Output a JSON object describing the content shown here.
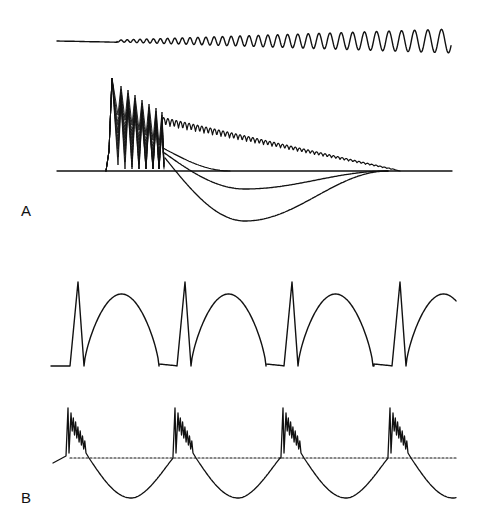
{
  "figure": {
    "panels": [
      {
        "label": "A",
        "traces": [
          {
            "name": "input-chirp",
            "description": "sinusoidal stimulus with increasing amplitude and decreasing frequency"
          },
          {
            "name": "membrane-responses",
            "description": "overlaid voltage responses: initial spike burst, decaying oscillation, and three hyperpolarizing afterpotentials of increasing depth"
          }
        ]
      },
      {
        "label": "B",
        "traces": [
          {
            "name": "periodic-input",
            "description": "periodic waveform with sharp spike followed by broad hump, 4 cycles"
          },
          {
            "name": "bursting-response",
            "description": "spike bursts followed by hyperpolarization, dotted reference baseline",
            "cycles": 4
          }
        ]
      }
    ],
    "colors": {
      "ink": "#111111",
      "background": "#ffffff"
    }
  }
}
